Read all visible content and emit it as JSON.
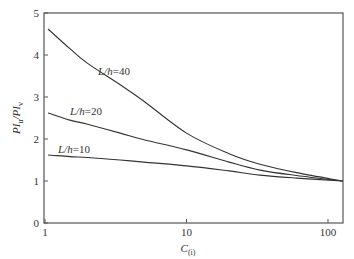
{
  "chart_data": {
    "type": "line",
    "title": "",
    "xlabel": "C_m",
    "ylabel": "PI_u/PI_v",
    "xscale": "log",
    "xlim": [
      1,
      127
    ],
    "ylim": [
      0,
      5
    ],
    "x_ticks": [
      1,
      10,
      100
    ],
    "x_tick_labels": [
      "1",
      "10",
      "100"
    ],
    "y_ticks": [
      0,
      1,
      2,
      3,
      4,
      5
    ],
    "y_tick_labels": [
      "0",
      "1",
      "2",
      "3",
      "4",
      "5"
    ],
    "grid": false,
    "legend": "inline labels",
    "x": [
      1.05,
      1.5,
      2,
      3.4,
      5,
      10,
      20,
      33,
      60,
      127
    ],
    "series": [
      {
        "name": "L/h=40",
        "label_main": "L/h",
        "label_value": "=40",
        "values": [
          4.62,
          4.15,
          3.8,
          3.29,
          2.9,
          2.14,
          1.65,
          1.4,
          1.2,
          1.0
        ]
      },
      {
        "name": "L/h=20",
        "label_main": "L/h",
        "label_value": "=20",
        "values": [
          2.62,
          2.45,
          2.35,
          2.14,
          1.98,
          1.74,
          1.45,
          1.26,
          1.13,
          1.0
        ]
      },
      {
        "name": "L/h=10",
        "label_main": "L/h",
        "label_value": "=10",
        "values": [
          1.62,
          1.58,
          1.56,
          1.5,
          1.45,
          1.36,
          1.24,
          1.14,
          1.07,
          1.0
        ]
      }
    ],
    "line_color": "#333333"
  },
  "axes": {
    "xlabel_main": "C",
    "xlabel_sub": "(i)",
    "ylabel_text": "PI",
    "ylabel_sub1": "u",
    "ylabel_sep": "/PI",
    "ylabel_sub2": "v"
  }
}
